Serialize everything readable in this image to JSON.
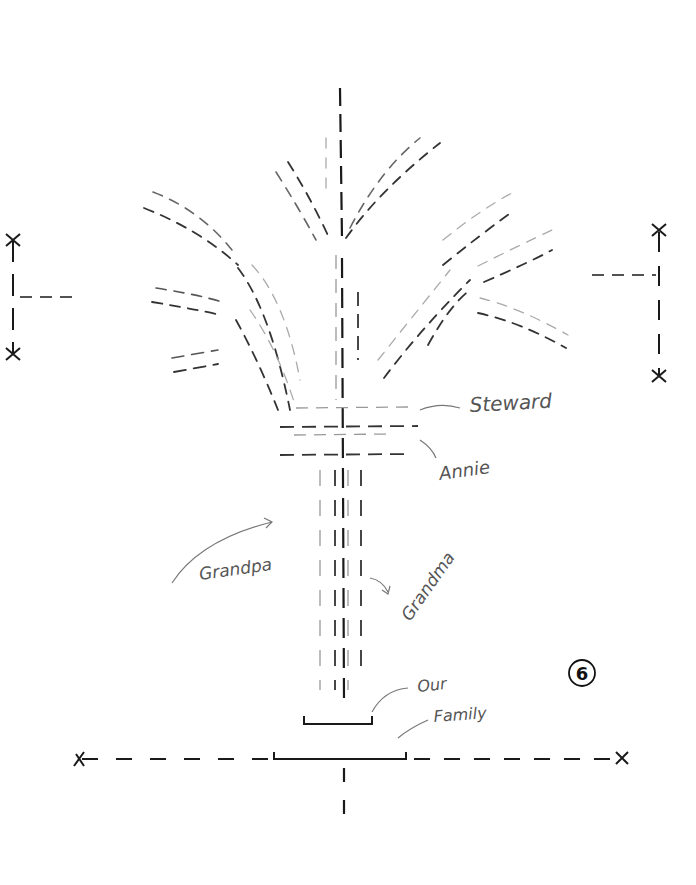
{
  "diagram": {
    "type": "hand-drawn family tree sketch",
    "page_number": "6",
    "labels": {
      "steward": "Steward",
      "annie": "Annie",
      "grandpa": "Grandpa",
      "grandma": "Grandma",
      "our": "Our",
      "family": "Family"
    },
    "colors": {
      "ink_dark": "#1a1a1a",
      "ink_mid": "#555555",
      "ink_light": "#9a9a9a",
      "background": "#ffffff"
    }
  }
}
